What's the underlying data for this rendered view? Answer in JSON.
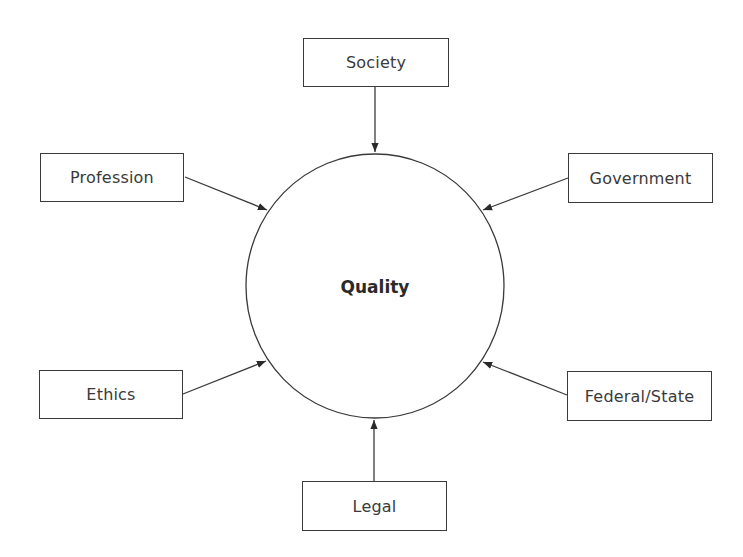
{
  "diagram": {
    "center": {
      "label": "Quality",
      "cx": 375,
      "cy": 286,
      "rx": 129,
      "ry": 132
    },
    "nodes": [
      {
        "id": "society",
        "label": "Society",
        "x": 303,
        "y": 38,
        "w": 146,
        "h": 49
      },
      {
        "id": "profession",
        "label": "Profession",
        "x": 40,
        "y": 153,
        "w": 144,
        "h": 49
      },
      {
        "id": "government",
        "label": "Government",
        "x": 568,
        "y": 153,
        "w": 145,
        "h": 50
      },
      {
        "id": "ethics",
        "label": "Ethics",
        "x": 39,
        "y": 370,
        "w": 144,
        "h": 49
      },
      {
        "id": "federal-state",
        "label": "Federal/State",
        "x": 567,
        "y": 371,
        "w": 145,
        "h": 50
      },
      {
        "id": "legal",
        "label": "Legal",
        "x": 302,
        "y": 481,
        "w": 145,
        "h": 50
      }
    ],
    "edges": [
      {
        "from": "society",
        "to": "quality",
        "x1": 375,
        "y1": 87,
        "x2": 375,
        "y2": 152
      },
      {
        "from": "profession",
        "to": "quality",
        "x1": 185,
        "y1": 177,
        "x2": 267,
        "y2": 210
      },
      {
        "from": "government",
        "to": "quality",
        "x1": 568,
        "y1": 178,
        "x2": 483,
        "y2": 210
      },
      {
        "from": "ethics",
        "to": "quality",
        "x1": 183,
        "y1": 394,
        "x2": 266,
        "y2": 361
      },
      {
        "from": "federal-state",
        "to": "quality",
        "x1": 567,
        "y1": 395,
        "x2": 483,
        "y2": 362
      },
      {
        "from": "legal",
        "to": "quality",
        "x1": 374,
        "y1": 481,
        "x2": 374,
        "y2": 420
      }
    ],
    "colors": {
      "stroke": "#3a3a3a",
      "text": "#3a3a3a",
      "background": "#ffffff"
    }
  }
}
